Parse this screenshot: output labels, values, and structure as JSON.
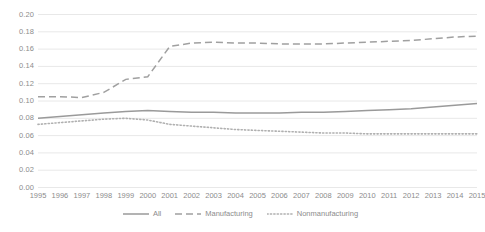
{
  "chart_data": {
    "type": "line",
    "title": "",
    "subtitle": "",
    "xlabel": "",
    "ylabel": "",
    "grid": true,
    "legend_position": "bottom",
    "xlim": [
      1995,
      2015
    ],
    "ylim": [
      0.0,
      0.2
    ],
    "ytick_step": 0.02,
    "categories": [
      "1995",
      "1996",
      "1997",
      "1998",
      "1999",
      "2000",
      "2001",
      "2002",
      "2003",
      "2004",
      "2005",
      "2006",
      "2007",
      "2008",
      "2009",
      "2010",
      "2011",
      "2012",
      "2013",
      "2014",
      "2015"
    ],
    "ytick_labels": [
      "0.20",
      "0.18",
      "0.16",
      "0.14",
      "0.12",
      "0.10",
      "0.08",
      "0.06",
      "0.04",
      "0.02",
      "0.00"
    ],
    "series": [
      {
        "name": "All",
        "style": "solid",
        "color": "#9a9a9a",
        "values": [
          0.08,
          0.082,
          0.084,
          0.086,
          0.088,
          0.089,
          0.088,
          0.087,
          0.087,
          0.086,
          0.086,
          0.086,
          0.087,
          0.087,
          0.088,
          0.089,
          0.09,
          0.091,
          0.093,
          0.095,
          0.097
        ]
      },
      {
        "name": "Manufacturing",
        "style": "dashed",
        "color": "#a0a0a0",
        "values": [
          0.105,
          0.105,
          0.104,
          0.11,
          0.125,
          0.128,
          0.163,
          0.167,
          0.168,
          0.167,
          0.167,
          0.166,
          0.166,
          0.166,
          0.167,
          0.168,
          0.169,
          0.17,
          0.172,
          0.174,
          0.175
        ]
      },
      {
        "name": "Nonmanufacturing",
        "style": "dotted",
        "color": "#b0b0b0",
        "values": [
          0.073,
          0.075,
          0.077,
          0.079,
          0.08,
          0.078,
          0.073,
          0.071,
          0.069,
          0.067,
          0.066,
          0.065,
          0.064,
          0.063,
          0.063,
          0.062,
          0.062,
          0.062,
          0.062,
          0.062,
          0.062
        ]
      }
    ],
    "colors": {
      "grid": "#e8e8e8",
      "tick_text": "#8c8c8c",
      "background": "#ffffff"
    }
  }
}
